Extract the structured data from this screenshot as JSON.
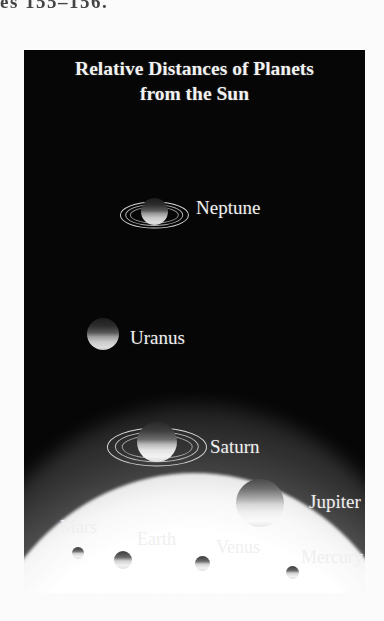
{
  "page": {
    "header_fragment": "es 155–156."
  },
  "figure": {
    "title_line1": "Relative Distances of Planets",
    "title_line2": "from the Sun",
    "background_color": "#060606",
    "label_color": "#efefef",
    "sun_label_color": "#1a1a1a"
  },
  "bodies": [
    {
      "name": "Neptune",
      "label": "Neptune",
      "has_rings": true,
      "size_px": 27,
      "x": 117,
      "y": 148,
      "label_x": 172,
      "label_y": 147,
      "label_size": 19,
      "label_tone": "light"
    },
    {
      "name": "Uranus",
      "label": "Uranus",
      "has_rings": false,
      "size_px": 32,
      "x": 63,
      "y": 268,
      "label_x": 106,
      "label_y": 277,
      "label_size": 19,
      "label_tone": "light"
    },
    {
      "name": "Saturn",
      "label": "Saturn",
      "has_rings": true,
      "size_px": 40,
      "x": 113,
      "y": 372,
      "label_x": 186,
      "label_y": 386,
      "label_size": 19,
      "label_tone": "light"
    },
    {
      "name": "Jupiter",
      "label": "Jupiter",
      "has_rings": false,
      "size_px": 48,
      "x": 212,
      "y": 429,
      "label_x": 285,
      "label_y": 441,
      "label_size": 19,
      "label_tone": "light"
    },
    {
      "name": "Mars",
      "label": "Mars",
      "has_rings": false,
      "size_px": 12,
      "x": 48,
      "y": 497,
      "label_x": 36,
      "label_y": 467,
      "label_size": 18,
      "label_tone": "light"
    },
    {
      "name": "Earth",
      "label": "Earth",
      "has_rings": false,
      "size_px": 18,
      "x": 90,
      "y": 501,
      "label_x": 113,
      "label_y": 479,
      "label_size": 18,
      "label_tone": "light"
    },
    {
      "name": "Venus",
      "label": "Venus",
      "has_rings": false,
      "size_px": 15,
      "x": 171,
      "y": 506,
      "label_x": 192,
      "label_y": 487,
      "label_size": 18,
      "label_tone": "light"
    },
    {
      "name": "Mercury",
      "label": "Mercury",
      "has_rings": false,
      "size_px": 13,
      "x": 262,
      "y": 516,
      "label_x": 277,
      "label_y": 497,
      "label_size": 18,
      "label_tone": "light"
    },
    {
      "name": "Sun",
      "label": "Sun",
      "has_rings": false,
      "size_px": 0,
      "x": 0,
      "y": 0,
      "label_x": 150,
      "label_y": 548,
      "label_size": 19,
      "label_tone": "dark"
    }
  ]
}
